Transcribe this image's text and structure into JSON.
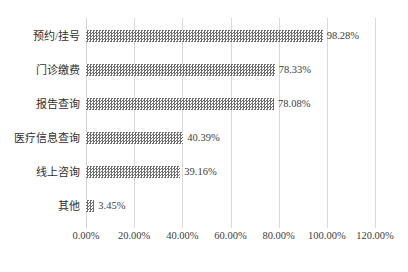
{
  "chart_data": {
    "type": "bar",
    "orientation": "horizontal",
    "title": "",
    "xlabel": "",
    "ylabel": "",
    "categories": [
      "预约/挂号",
      "门诊缴费",
      "报告查询",
      "医疗信息查询",
      "线上咨询",
      "其他"
    ],
    "values": [
      98.28,
      78.33,
      78.08,
      40.39,
      39.16,
      3.45
    ],
    "value_labels": [
      "98.28%",
      "78.33%",
      "78.08%",
      "40.39%",
      "39.16%",
      "3.45%"
    ],
    "xlim": [
      0,
      120
    ],
    "xticks": [
      0,
      20,
      40,
      60,
      80,
      100,
      120
    ],
    "xtick_labels": [
      "0.00%",
      "20.00%",
      "40.00%",
      "60.00%",
      "80.00%",
      "100.00%",
      "120.00%"
    ],
    "grid": "vertical",
    "legend": "none",
    "bar_fill": "checkerboard-dither-gray",
    "bar_color": "#6e6e6e",
    "gridline_color": "#d9d9d9",
    "text_color": "#3d3d3d"
  },
  "bottom_caption": ""
}
